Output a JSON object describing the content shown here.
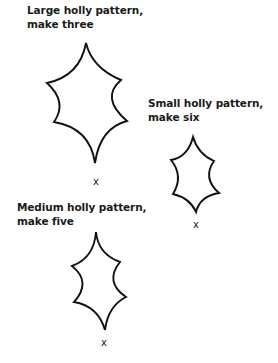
{
  "patterns": [
    {
      "id": "large",
      "label_line1": "Large holly pattern,",
      "label_line2": "make three",
      "size": "Large",
      "quantity": "three",
      "mark": "x"
    },
    {
      "id": "small",
      "label_line1": "Small holly pattern,",
      "label_line2": "make six",
      "size": "Small",
      "quantity": "six",
      "mark": "x"
    },
    {
      "id": "medium",
      "label_line1": "Medium holly pattern,",
      "label_line2": "make five",
      "size": "Medium",
      "quantity": "five",
      "mark": "x"
    }
  ],
  "colors": {
    "stroke": "#111111",
    "text": "#1a1a1a",
    "background": "#ffffff"
  }
}
